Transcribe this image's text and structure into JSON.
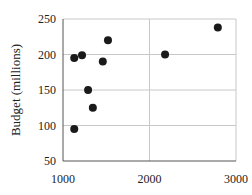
{
  "chart_data": {
    "type": "scatter",
    "title": "",
    "xlabel": "",
    "ylabel": "Budget (millions)",
    "xlim": [
      1000,
      3000
    ],
    "ylim": [
      50,
      250
    ],
    "xticks": [
      1000,
      2000,
      3000
    ],
    "yticks": [
      50,
      100,
      150,
      200,
      250
    ],
    "grid": true,
    "legend": null,
    "points": [
      {
        "x": 1130,
        "y": 195
      },
      {
        "x": 1220,
        "y": 199
      },
      {
        "x": 1520,
        "y": 220
      },
      {
        "x": 1460,
        "y": 190
      },
      {
        "x": 1290,
        "y": 150
      },
      {
        "x": 1345,
        "y": 125
      },
      {
        "x": 1130,
        "y": 95
      },
      {
        "x": 2180,
        "y": 200
      },
      {
        "x": 2790,
        "y": 238
      }
    ],
    "marker_color": "#1a1a1a",
    "grid_color": "#c8c8c8"
  }
}
